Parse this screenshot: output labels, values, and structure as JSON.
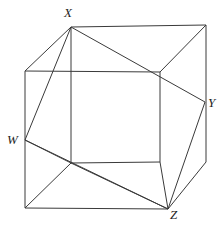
{
  "figure": {
    "kind": "geometry-diagram",
    "canvas": {
      "width": 224,
      "height": 230,
      "background": "#ffffff"
    },
    "stroke_color": "#3a3a3a",
    "label_color": "#1d1d1d",
    "vertices": [
      {
        "id": "X",
        "label": "X",
        "point_x": 71,
        "point_y": 27,
        "label_x": 64,
        "label_y": 6
      },
      {
        "id": "Y",
        "label": "Y",
        "point_x": 205,
        "point_y": 102,
        "label_x": 208,
        "label_y": 96
      },
      {
        "id": "W",
        "label": "W",
        "point_x": 25,
        "point_y": 140,
        "label_x": 7,
        "label_y": 133
      },
      {
        "id": "Z",
        "label": "Z",
        "point_x": 168,
        "point_y": 209,
        "label_x": 170,
        "label_y": 208
      }
    ],
    "cube_corners": {
      "front_top_left": [
        25,
        71
      ],
      "front_top_right": [
        160,
        72
      ],
      "front_bottom_left": [
        25,
        208
      ],
      "front_bottom_right": [
        160,
        162
      ],
      "back_top_left": [
        71,
        27
      ],
      "back_top_right": [
        206,
        25
      ],
      "back_bottom_left": [
        71,
        163
      ],
      "back_bottom_right": [
        206,
        162
      ],
      "lower_front_right": [
        168,
        209
      ]
    },
    "edges": [
      {
        "name": "cube-edge-front-top",
        "d": "M 25,71 L 160,72"
      },
      {
        "name": "cube-edge-front-left",
        "d": "M 25,71 L 25,208"
      },
      {
        "name": "cube-edge-front-right",
        "d": "M 160,72 L 160,162"
      },
      {
        "name": "cube-edge-front-bottom",
        "d": "M 25,208 L 168,209"
      },
      {
        "name": "cube-edge-inner-bottom",
        "d": "M 71,163 L 160,162"
      },
      {
        "name": "cube-edge-inner-left",
        "d": "M 71,27 L 71,163"
      },
      {
        "name": "cube-edge-back-top",
        "d": "M 71,27 L 206,25"
      },
      {
        "name": "cube-edge-back-right",
        "d": "M 206,25 L 206,162"
      },
      {
        "name": "cube-edge-top-left-slant",
        "d": "M 25,71 L 71,27"
      },
      {
        "name": "cube-edge-top-right-slant",
        "d": "M 160,72 L 206,25"
      },
      {
        "name": "cube-edge-bottom-right-slant",
        "d": "M 168,209 L 206,162"
      },
      {
        "name": "cube-edge-bottom-left-slant",
        "d": "M 25,208 L 71,163"
      },
      {
        "name": "inscribed-edge-w-x",
        "d": "M 25,140 L 71,27"
      },
      {
        "name": "inscribed-edge-x-y",
        "d": "M 71,27 L 205,102"
      },
      {
        "name": "inscribed-edge-y-z",
        "d": "M 205,102 L 168,209"
      },
      {
        "name": "inscribed-edge-w-z",
        "d": "M 25,140 L 168,209"
      },
      {
        "name": "inscribed-diagonal-w-inner",
        "d": "M 25,140 L 71,163"
      },
      {
        "name": "inscribed-diagonal-inner-z",
        "d": "M 71,163 L 168,209"
      },
      {
        "name": "inscribed-diagonal-inner-right-z",
        "d": "M 160,162 L 168,209"
      }
    ]
  }
}
